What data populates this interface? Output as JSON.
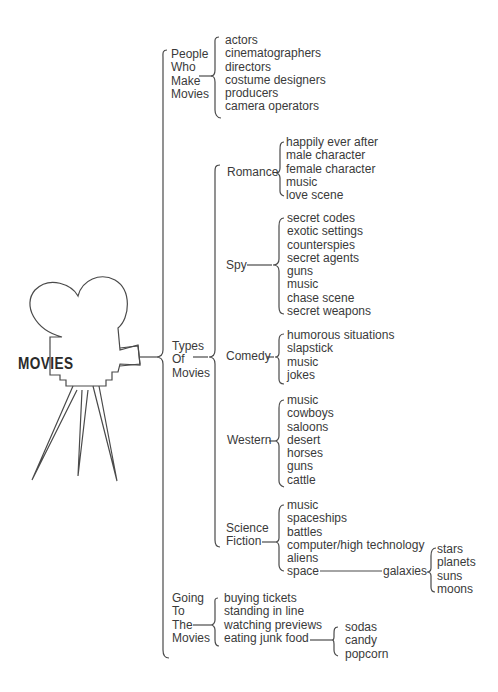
{
  "center": "MOVIES",
  "branches": {
    "people": {
      "label": [
        "People",
        "Who",
        "Make",
        "Movies"
      ],
      "items": [
        "actors",
        "cinematographers",
        "directors",
        "costume designers",
        "producers",
        "camera operators"
      ]
    },
    "types": {
      "label": [
        "Types",
        "Of",
        "Movies"
      ],
      "romance": {
        "label": "Romance",
        "items": [
          "happily ever after",
          "male character",
          "female character",
          "music",
          "love scene"
        ]
      },
      "spy": {
        "label": "Spy",
        "items": [
          "secret codes",
          "exotic settings",
          "counterspies",
          "secret agents",
          "guns",
          "music",
          "chase scene",
          "secret weapons"
        ]
      },
      "comedy": {
        "label": "Comedy",
        "items": [
          "humorous situations",
          "slapstick",
          "music",
          "jokes"
        ]
      },
      "western": {
        "label": "Western",
        "items": [
          "music",
          "cowboys",
          "saloons",
          "desert",
          "horses",
          "guns",
          "cattle"
        ]
      },
      "scifi": {
        "label": [
          "Science",
          "Fiction"
        ],
        "items": [
          "music",
          "spaceships",
          "battles",
          "computer/high technology",
          "aliens",
          "space"
        ],
        "galaxies": {
          "label": "galaxies",
          "items": [
            "stars",
            "planets",
            "suns",
            "moons"
          ]
        }
      }
    },
    "going": {
      "label": [
        "Going",
        "To",
        "The",
        "Movies"
      ],
      "items": [
        "buying tickets",
        "standing in line",
        "watching previews",
        "eating junk food"
      ],
      "junk_food": [
        "sodas",
        "candy",
        "popcorn"
      ]
    }
  }
}
